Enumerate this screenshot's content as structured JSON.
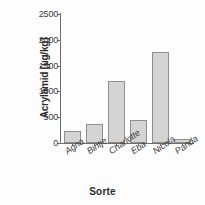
{
  "chart_data": {
    "type": "bar",
    "title": "",
    "categories": [
      "Agna",
      "Bintje",
      "Charlotte",
      "Eba",
      "Nicola",
      "Panda"
    ],
    "values": [
      230,
      370,
      1200,
      440,
      1770,
      85
    ],
    "xlabel": "Sorte",
    "ylabel": "Acrylamid [µg/kg]",
    "ylim": [
      0,
      2500
    ],
    "yticks": [
      0,
      500,
      1000,
      1500,
      2000,
      2500
    ],
    "ytick_labels": [
      "0",
      "500",
      "1000",
      "1500",
      "2000",
      "2500"
    ],
    "grid": false,
    "legend": null,
    "bar_fill_color": "#d4d4d4",
    "bar_border_color": "#8f8f8f",
    "axis_color": "#6d6d6d"
  }
}
